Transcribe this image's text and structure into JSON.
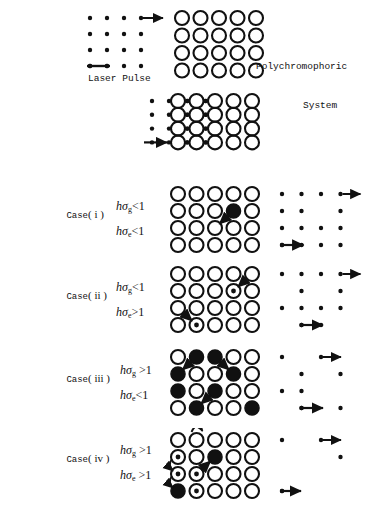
{
  "figure": {
    "title_top_right": "Polychromophoric\n      System",
    "polychromophoric_label_line1": "Polychromophoric",
    "polychromophoric_label_line2": "System",
    "laser_pulse_label": "Laser Pulse",
    "colors": {
      "ink": "#111111",
      "background": "#ffffff",
      "filled_chromophore": "#000000",
      "open_chromophore_stroke": "#111111"
    },
    "geometry": {
      "grid_cols": 5,
      "grid_rows": 4,
      "pulse_grid_cols": 4,
      "pulse_grid_rows": 4,
      "circle_radius": 7,
      "dot_radius": 2.2
    }
  },
  "top": {
    "pulse_grid": {
      "name": "laser-pulse-dot-grid",
      "rows": 4,
      "cols": 4,
      "dots": [
        [
          1,
          1,
          1,
          1
        ],
        [
          1,
          1,
          1,
          1
        ],
        [
          1,
          1,
          1,
          1
        ],
        [
          1,
          1,
          1,
          1
        ]
      ],
      "arrow_rows": [
        1
      ],
      "pulse_bar_row": 4
    },
    "system_grid": {
      "name": "polychromophoric-circle-grid",
      "rows": 4,
      "cols": 5,
      "states": [
        [
          "open",
          "open",
          "open",
          "open",
          "open"
        ],
        [
          "open",
          "open",
          "open",
          "open",
          "open"
        ],
        [
          "open",
          "open",
          "open",
          "open",
          "open"
        ],
        [
          "open",
          "open",
          "open",
          "open",
          "open"
        ]
      ]
    }
  },
  "interaction": {
    "name": "pulse-system-interaction",
    "rows": 4,
    "cols": 5,
    "left_dots": [
      1,
      1,
      1,
      1
    ],
    "left_arrow_row": 4,
    "coupled_cols": [
      1,
      2,
      3
    ],
    "states": [
      [
        "open",
        "open",
        "open",
        "open",
        "open"
      ],
      [
        "open",
        "open",
        "open",
        "open",
        "open"
      ],
      [
        "open",
        "open",
        "open",
        "open",
        "open"
      ],
      [
        "open",
        "open",
        "open",
        "open",
        "open"
      ]
    ]
  },
  "cases": [
    {
      "id": "case-i",
      "case_word": "Case",
      "roman": "( i )",
      "cond_g": {
        "h": "h",
        "sigma": "σ",
        "sub": "g",
        "op": "<",
        "value": "1"
      },
      "cond_e": {
        "h": "h",
        "sigma": "σ",
        "sub": "e",
        "op": "<",
        "value": "1"
      },
      "circle_grid": {
        "states": [
          [
            "open",
            "open",
            "open",
            "open",
            "open"
          ],
          [
            "open",
            "open",
            "open",
            "filled",
            "open"
          ],
          [
            "open",
            "open",
            "open",
            "open",
            "open"
          ],
          [
            "open",
            "open",
            "open",
            "open",
            "open"
          ]
        ],
        "arrows": [
          {
            "from_row": 2,
            "from_col": 4,
            "to_row": 3,
            "to_col": 3,
            "style": "straight"
          }
        ]
      },
      "dot_grid": {
        "dots": [
          [
            1,
            1,
            1,
            1
          ],
          [
            1,
            1,
            0,
            1
          ],
          [
            1,
            1,
            1,
            1
          ],
          [
            1,
            1,
            1,
            1
          ]
        ],
        "row_arrows": [
          {
            "row": 1,
            "type": "tail-right"
          }
        ],
        "bar_arrows": [
          {
            "row": 4,
            "from_col": 1,
            "to_col": 2
          }
        ]
      }
    },
    {
      "id": "case-ii",
      "case_word": "Case",
      "roman": "( ii )",
      "cond_g": {
        "h": "h",
        "sigma": "σ",
        "sub": "g",
        "op": "<",
        "value": "1"
      },
      "cond_e": {
        "h": "h",
        "sigma": "σ",
        "sub": "e",
        "op": ">",
        "value": "1"
      },
      "circle_grid": {
        "states": [
          [
            "open",
            "open",
            "open",
            "open",
            "open"
          ],
          [
            "open",
            "open",
            "open",
            "dotted",
            "open"
          ],
          [
            "open",
            "open",
            "open",
            "open",
            "open"
          ],
          [
            "open",
            "dotted",
            "open",
            "open",
            "open"
          ]
        ],
        "arrows": [
          {
            "from_row": 1,
            "from_col": 5,
            "to_row": 2,
            "to_col": 4,
            "style": "straight"
          },
          {
            "from_row": 3,
            "from_col": 1,
            "to_row": 4,
            "to_col": 2,
            "style": "straight"
          }
        ]
      },
      "dot_grid": {
        "dots": [
          [
            1,
            1,
            1,
            1
          ],
          [
            0,
            1,
            0,
            1
          ],
          [
            1,
            1,
            1,
            1
          ],
          [
            0,
            1,
            1,
            0
          ]
        ],
        "row_arrows": [
          {
            "row": 1,
            "type": "tail-right"
          }
        ],
        "bar_arrows": [
          {
            "row": 4,
            "from_col": 2,
            "to_col": 3
          }
        ]
      }
    },
    {
      "id": "case-iii",
      "case_word": "Case",
      "roman": "( iii )",
      "cond_g": {
        "h": "h",
        "sigma": "σ",
        "sub": "g",
        "op": ">",
        "value": "1"
      },
      "cond_e": {
        "h": "h",
        "sigma": "σ",
        "sub": "e",
        "op": "<",
        "value": "1"
      },
      "circle_grid": {
        "states": [
          [
            "open",
            "filled",
            "filled",
            "open",
            "open"
          ],
          [
            "filled",
            "open",
            "open",
            "filled",
            "open"
          ],
          [
            "filled",
            "open",
            "filled",
            "open",
            "open"
          ],
          [
            "open",
            "filled",
            "open",
            "open",
            "filled"
          ]
        ],
        "arrows": [
          {
            "from_row": 1,
            "from_col": 2,
            "to_row": 2,
            "to_col": 1,
            "style": "straight"
          },
          {
            "from_row": 1,
            "from_col": 3,
            "to_row": 2,
            "to_col": 4,
            "style": "straight"
          },
          {
            "from_row": 3,
            "from_col": 3,
            "to_row": 4,
            "to_col": 2,
            "style": "straight"
          }
        ]
      },
      "dot_grid": {
        "dots": [
          [
            1,
            0,
            1,
            0
          ],
          [
            0,
            1,
            0,
            1
          ],
          [
            1,
            1,
            0,
            0
          ],
          [
            0,
            1,
            0,
            1
          ]
        ],
        "row_arrows": [
          {
            "row": 1,
            "type": "tail-right-col3"
          }
        ],
        "bar_arrows": [
          {
            "row": 4,
            "from_col": 2,
            "to_col": 3
          }
        ]
      }
    },
    {
      "id": "case-iv",
      "case_word": "Case",
      "roman": "( iv )",
      "cond_g": {
        "h": "h",
        "sigma": "σ",
        "sub": "g",
        "op": ">",
        "value": "1"
      },
      "cond_e": {
        "h": "h",
        "sigma": "σ",
        "sub": "e",
        "op": ">",
        "value": "1"
      },
      "circle_grid": {
        "states": [
          [
            "open",
            "open",
            "open",
            "open",
            "open"
          ],
          [
            "dotted",
            "open",
            "filled",
            "open",
            "open"
          ],
          [
            "dotted",
            "dotted",
            "open",
            "open",
            "open"
          ],
          [
            "filled",
            "dotted",
            "open",
            "open",
            "open"
          ]
        ],
        "arrows": [
          {
            "from_row": 1,
            "from_col": 2,
            "to_row": 1,
            "to_col": 2,
            "style": "curved"
          },
          {
            "from_row": 2,
            "from_col": 1,
            "to_row": 3,
            "to_col": 1,
            "style": "curved"
          },
          {
            "from_row": 3,
            "from_col": 2,
            "to_row": 2,
            "to_col": 3,
            "style": "straight"
          },
          {
            "from_row": 3,
            "from_col": 1,
            "to_row": 4,
            "to_col": 1,
            "style": "curved"
          }
        ]
      },
      "dot_grid": {
        "dots": [
          [
            1,
            0,
            1,
            0
          ],
          [
            0,
            0,
            0,
            1
          ],
          [
            0,
            0,
            0,
            0
          ],
          [
            1,
            0,
            0,
            0
          ]
        ],
        "row_arrows": [
          {
            "row": 1,
            "type": "tail-right-col3"
          }
        ],
        "bar_arrows": [
          {
            "row": 4,
            "from_col": 1,
            "to_col": 1
          }
        ]
      }
    }
  ]
}
